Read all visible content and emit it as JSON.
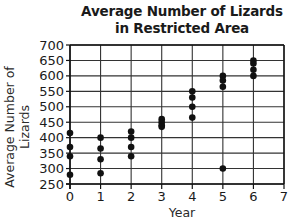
{
  "chart_data": {
    "type": "scatter",
    "title": "Average Number of Lizards in Restricted Area",
    "title_lines": [
      "Average Number of Lizards",
      "in Restricted Area"
    ],
    "xlabel": "Year",
    "ylabel": "Average Number of Lizards",
    "xlim": [
      0,
      7
    ],
    "ylim": [
      250,
      700
    ],
    "x_ticks": [
      0,
      1,
      2,
      3,
      4,
      5,
      6,
      7
    ],
    "y_ticks": [
      250,
      300,
      350,
      400,
      450,
      500,
      550,
      600,
      650,
      700
    ],
    "grid": true,
    "legend": null,
    "points": [
      {
        "x": 0,
        "y": 415
      },
      {
        "x": 0,
        "y": 370
      },
      {
        "x": 0,
        "y": 340
      },
      {
        "x": 0,
        "y": 280
      },
      {
        "x": 1,
        "y": 400
      },
      {
        "x": 1,
        "y": 365
      },
      {
        "x": 1,
        "y": 330
      },
      {
        "x": 1,
        "y": 285
      },
      {
        "x": 2,
        "y": 420
      },
      {
        "x": 2,
        "y": 400
      },
      {
        "x": 2,
        "y": 370
      },
      {
        "x": 2,
        "y": 340
      },
      {
        "x": 3,
        "y": 460
      },
      {
        "x": 3,
        "y": 450
      },
      {
        "x": 3,
        "y": 440
      },
      {
        "x": 3,
        "y": 435
      },
      {
        "x": 4,
        "y": 550
      },
      {
        "x": 4,
        "y": 530
      },
      {
        "x": 4,
        "y": 500
      },
      {
        "x": 4,
        "y": 465
      },
      {
        "x": 5,
        "y": 600
      },
      {
        "x": 5,
        "y": 585
      },
      {
        "x": 5,
        "y": 565
      },
      {
        "x": 5,
        "y": 300
      },
      {
        "x": 6,
        "y": 650
      },
      {
        "x": 6,
        "y": 640
      },
      {
        "x": 6,
        "y": 620
      },
      {
        "x": 6,
        "y": 600
      }
    ],
    "colors": {
      "points": "#111111",
      "grid": "#333333",
      "axis": "#111111",
      "text": "#1a1a1a"
    }
  }
}
